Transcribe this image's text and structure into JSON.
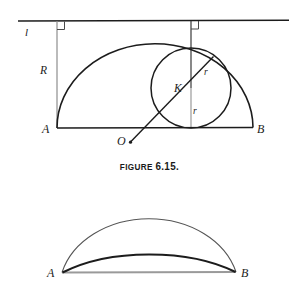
{
  "page": {
    "width": 299,
    "height": 297,
    "background": "#ffffff"
  },
  "caption": {
    "prefix": "FIGURE ",
    "number": "6.15."
  },
  "figure_top": {
    "name": "figure-6-15-top",
    "labels": {
      "line_l": "l",
      "radius_R": "R",
      "point_A": "A",
      "point_B": "B",
      "point_O": "O",
      "center_K": "K",
      "radius_r_upper": "r",
      "radius_r_lower": "r"
    },
    "colors": {
      "stroke_dark": "#1c1c1c",
      "stroke_gray": "#8a8a8a",
      "stroke_mid": "#3a3a3a"
    }
  },
  "figure_bottom": {
    "name": "figure-6-15-bottom",
    "labels": {
      "point_A": "A",
      "point_B": "B"
    },
    "colors": {
      "arc_outer": "#555555",
      "arc_inner": "#1c1c1c",
      "baseline": "#9a9a9a"
    }
  }
}
